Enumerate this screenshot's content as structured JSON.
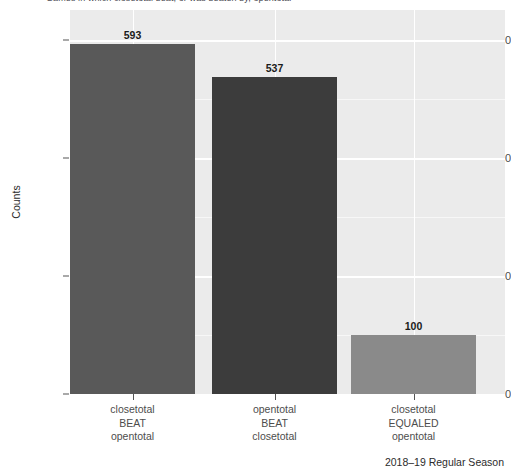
{
  "chart_data": {
    "type": "bar",
    "title": "Games in which closetotal beat, or was beaten by, opentotal",
    "caption": "2018–19 Regular Season",
    "xlabel": "",
    "ylabel": "Counts",
    "categories": [
      "closetotal BEAT opentotal",
      "opentotal BEAT closetotal",
      "closetotal EQUALED opentotal"
    ],
    "category_lines": [
      [
        "closetotal",
        "BEAT",
        "opentotal"
      ],
      [
        "opentotal",
        "BEAT",
        "closetotal"
      ],
      [
        "closetotal",
        "EQUALED",
        "opentotal"
      ]
    ],
    "values": [
      593,
      537,
      100
    ],
    "value_labels": [
      "593",
      "537",
      "100"
    ],
    "bar_colors": [
      "#595959",
      "#3c3c3c",
      "#8a8a8a"
    ],
    "ylim": [
      0,
      620
    ],
    "yticks": [
      0,
      200,
      400,
      600
    ],
    "ytick_labels": [
      "0",
      "200",
      "400",
      "600"
    ],
    "y_minor_ticks": [
      100,
      300,
      500
    ],
    "grid": true,
    "legend": "none",
    "panel_background": "#ebebeb",
    "grid_color": "#ffffff"
  }
}
